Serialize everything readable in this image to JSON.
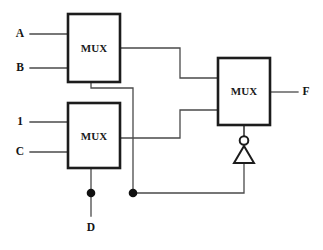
{
  "diagram": {
    "type": "digital-logic-schematic",
    "line_color": "#4a4a4a",
    "box_stroke_color": "#1c1c1c",
    "background": "#ffffff"
  },
  "blocks": [
    {
      "id": "mux-top",
      "label": "MUX",
      "x": 68,
      "y": 14,
      "w": 52,
      "h": 68
    },
    {
      "id": "mux-bottom",
      "label": "MUX",
      "x": 68,
      "y": 103,
      "w": 52,
      "h": 65
    },
    {
      "id": "mux-right",
      "label": "MUX",
      "x": 218,
      "y": 58,
      "w": 52,
      "h": 67
    }
  ],
  "inputs": [
    {
      "id": "input-a",
      "label": "A",
      "label_x": 20,
      "label_y": 34,
      "wire_y": 34,
      "wire_x1": 30,
      "wire_x2": 68
    },
    {
      "id": "input-b",
      "label": "B",
      "label_x": 20,
      "label_y": 68,
      "wire_y": 68,
      "wire_x1": 30,
      "wire_x2": 68
    },
    {
      "id": "input-1",
      "label": "1",
      "label_x": 20,
      "label_y": 122,
      "wire_y": 122,
      "wire_x1": 30,
      "wire_x2": 68
    },
    {
      "id": "input-c",
      "label": "C",
      "label_x": 20,
      "label_y": 152,
      "wire_y": 152,
      "wire_x1": 30,
      "wire_x2": 68
    },
    {
      "id": "input-d",
      "label": "D",
      "label_x": 91,
      "label_y": 228,
      "wire_x": 91,
      "wire_y1": 193,
      "wire_y2": 216
    }
  ],
  "outputs": [
    {
      "id": "output-f",
      "label": "F",
      "label_x": 306,
      "label_y": 92,
      "wire_y": 92,
      "wire_x1": 270,
      "wire_x2": 298
    }
  ],
  "gates": [
    {
      "id": "inverter",
      "type": "not-gate",
      "cx": 244,
      "bubble_cy": 140,
      "bubble_r": 4.2,
      "apex_y": 146,
      "base_y": 163,
      "half_width": 10
    }
  ],
  "junctions": [
    {
      "id": "junction-d-left",
      "x": 91,
      "y": 193,
      "r": 4.2
    },
    {
      "id": "junction-d-right",
      "x": 133,
      "y": 193,
      "r": 4.2
    }
  ],
  "nets": [
    {
      "id": "net-mux-top-out",
      "from": "mux-top output",
      "to": "mux-right input 0",
      "path": "M 120 48 L 180 48 L 180 78 L 218 78"
    },
    {
      "id": "net-mux-bottom-out",
      "from": "mux-bottom output",
      "to": "mux-right input 1",
      "path": "M 120 138 L 180 138 L 180 110 L 218 110"
    },
    {
      "id": "net-sel-top",
      "from": "mux-top select",
      "to": "junction-d-right",
      "path": "M 91 82 L 91 88 L 133 88 L 133 193"
    },
    {
      "id": "net-sel-bottom",
      "from": "mux-bottom select",
      "to": "junction-d-left",
      "path": "M 91 168 L 91 193"
    },
    {
      "id": "net-d-rail",
      "from": "junction-d-right",
      "to": "inverter input",
      "path": "M 133 193 L 244 193 L 244 163"
    },
    {
      "id": "net-inv-out",
      "from": "inverter output",
      "to": "mux-right select",
      "path": "M 244 136 L 244 125"
    }
  ]
}
